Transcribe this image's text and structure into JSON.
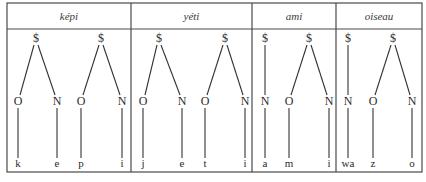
{
  "columns": [
    {
      "word": "képi",
      "x0": 7,
      "x1": 131
    },
    {
      "word": "yéti",
      "x0": 131,
      "x1": 252
    },
    {
      "word": "ami",
      "x0": 252,
      "x1": 336
    },
    {
      "word": "oiseau",
      "x0": 336,
      "x1": 422
    }
  ],
  "syllable_symbol": "$",
  "syllables": [
    {
      "word": "képi",
      "root_x": 36,
      "branches": [
        {
          "node": "O",
          "x": 18,
          "segment": "k"
        },
        {
          "node": "N",
          "x": 57,
          "segment": "e"
        }
      ]
    },
    {
      "word": "képi",
      "root_x": 101,
      "branches": [
        {
          "node": "O",
          "x": 81,
          "segment": "p"
        },
        {
          "node": "N",
          "x": 122,
          "segment": "i"
        }
      ]
    },
    {
      "word": "yéti",
      "root_x": 159,
      "branches": [
        {
          "node": "O",
          "x": 143,
          "segment": "j"
        },
        {
          "node": "N",
          "x": 182,
          "segment": "e"
        }
      ]
    },
    {
      "word": "yéti",
      "root_x": 225,
      "branches": [
        {
          "node": "O",
          "x": 205,
          "segment": "t"
        },
        {
          "node": "N",
          "x": 245,
          "segment": "i"
        }
      ]
    },
    {
      "word": "ami",
      "root_x": 265,
      "branches": [
        {
          "node": "N",
          "x": 265,
          "segment": "a"
        }
      ]
    },
    {
      "word": "ami",
      "root_x": 309,
      "branches": [
        {
          "node": "O",
          "x": 289,
          "segment": "m"
        },
        {
          "node": "N",
          "x": 329,
          "segment": "i"
        }
      ]
    },
    {
      "word": "oiseau",
      "root_x": 348,
      "branches": [
        {
          "node": "N",
          "x": 348,
          "segment": "wa"
        }
      ]
    },
    {
      "word": "oiseau",
      "root_x": 393,
      "branches": [
        {
          "node": "O",
          "x": 373,
          "segment": "z"
        },
        {
          "node": "N",
          "x": 412,
          "segment": "o"
        }
      ]
    }
  ],
  "layout": {
    "frame": {
      "left": 7,
      "right": 422,
      "top": 3,
      "header_bottom": 29,
      "bottom": 172
    },
    "header_y": 20,
    "root_y": 42,
    "node_y": 105,
    "segment_y": 167
  },
  "colors": {
    "line": "#333333",
    "text": "#2a2a2a",
    "frame": "#4a4a4a"
  }
}
